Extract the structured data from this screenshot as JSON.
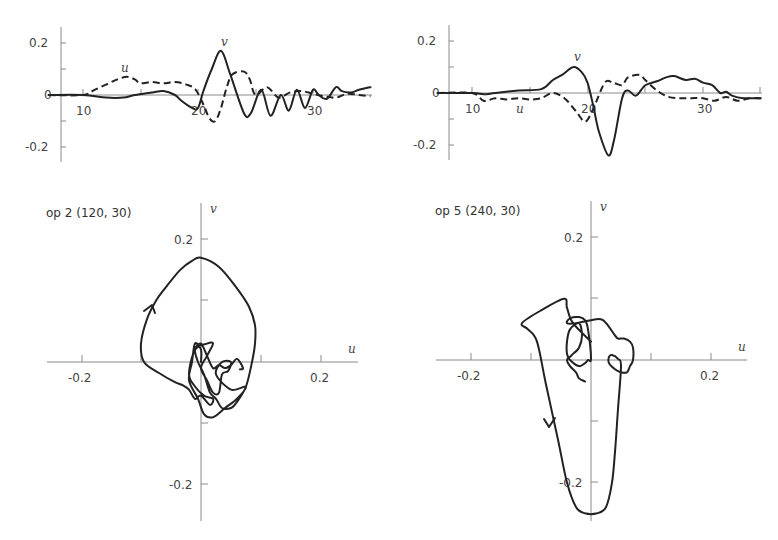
{
  "chart_data": [
    {
      "id": "ts_left",
      "type": "line",
      "xlabel": "",
      "ylabel": "",
      "xlim": [
        7,
        35
      ],
      "ylim": [
        -0.26,
        0.26
      ],
      "xticks": [
        10,
        15,
        20,
        25,
        30
      ],
      "xtick_labels": [
        "10",
        "",
        "20",
        "",
        "30"
      ],
      "yticks": [
        0.2,
        0.1,
        0,
        -0.1,
        -0.2
      ],
      "ytick_labels": [
        "0.2",
        "",
        "0",
        "",
        "-0.2"
      ],
      "annotations": [
        {
          "text": "u",
          "x": 15,
          "y": 0.09
        },
        {
          "text": "v",
          "x": 21.8,
          "y": 0.2
        }
      ],
      "series": [
        {
          "name": "u",
          "style": "dashed",
          "x": [
            7,
            10,
            11,
            12,
            13,
            13.8,
            14.5,
            15,
            16,
            17,
            18,
            19,
            19.8,
            20.5,
            21,
            21.5,
            22,
            22.5,
            23,
            24,
            24.5,
            25,
            26,
            27,
            28,
            29,
            30,
            31,
            32,
            33,
            34,
            35
          ],
          "y": [
            0,
            0,
            0.02,
            0.04,
            0.06,
            0.07,
            0.06,
            0.045,
            0.05,
            0.045,
            0.05,
            0.04,
            0.02,
            -0.04,
            -0.09,
            -0.1,
            -0.05,
            0.03,
            0.08,
            0.09,
            0.06,
            0.0,
            0.03,
            -0.01,
            0.01,
            0.015,
            0.005,
            -0.005,
            -0.01,
            0.005,
            0.0,
            -0.005
          ]
        },
        {
          "name": "v",
          "style": "solid",
          "x": [
            7,
            10,
            12,
            13.5,
            14.5,
            16,
            17,
            18,
            18.5,
            19.5,
            20,
            20.5,
            21.2,
            22,
            22.8,
            24,
            24.6,
            25.5,
            26.3,
            27.2,
            27.9,
            28.6,
            29.3,
            30,
            30.5,
            31.2,
            32,
            32.5,
            33.3,
            34,
            35
          ],
          "y": [
            0,
            0,
            -0.01,
            -0.01,
            0.0,
            0.01,
            0.015,
            0.0,
            -0.02,
            -0.05,
            -0.05,
            0.02,
            0.1,
            0.17,
            0.08,
            -0.07,
            -0.07,
            0.02,
            -0.08,
            0.0,
            -0.06,
            0.02,
            -0.05,
            0.02,
            0.0,
            -0.015,
            0.03,
            0.015,
            0.01,
            0.02,
            0.03
          ]
        }
      ]
    },
    {
      "id": "ts_right",
      "type": "line",
      "xlabel": "",
      "ylabel": "",
      "xlim": [
        7,
        35
      ],
      "ylim": [
        -0.26,
        0.26
      ],
      "xticks": [
        10,
        15,
        20,
        25,
        30,
        35
      ],
      "xtick_labels": [
        "10",
        "",
        "20",
        "",
        "30",
        ""
      ],
      "yticks": [
        0.2,
        0.1,
        0,
        -0.1,
        -0.2
      ],
      "ytick_labels": [
        "0.2",
        "",
        "0",
        "",
        "-0.2"
      ],
      "annotations": [
        {
          "text": "u",
          "x": 14,
          "y": -0.06
        },
        {
          "text": "v",
          "x": 18.8,
          "y": 0.13
        }
      ],
      "series": [
        {
          "name": "u",
          "style": "dashed",
          "x": [
            7,
            10,
            11,
            12,
            13,
            14,
            15,
            16,
            17,
            18,
            19,
            19.8,
            20.5,
            21.5,
            22.2,
            23,
            23.5,
            24.5,
            25,
            26,
            27,
            28,
            29,
            30,
            31,
            32,
            33,
            34,
            35
          ],
          "y": [
            0,
            0,
            -0.03,
            -0.02,
            -0.025,
            -0.02,
            -0.025,
            -0.02,
            0.0,
            -0.02,
            -0.07,
            -0.11,
            -0.06,
            0.04,
            0.04,
            0.03,
            0.06,
            0.07,
            0.05,
            0.01,
            -0.015,
            -0.02,
            -0.02,
            -0.02,
            -0.03,
            -0.015,
            -0.03,
            -0.02,
            -0.02
          ]
        },
        {
          "name": "v",
          "style": "solid",
          "x": [
            7,
            10,
            11,
            12,
            14,
            16,
            17,
            17.8,
            18.8,
            19.5,
            20,
            20.5,
            21,
            21.8,
            22.3,
            23,
            23.5,
            24.2,
            25,
            26,
            26.8,
            27.5,
            28.5,
            29.3,
            30,
            30.8,
            31.5,
            32,
            32.5,
            33.5,
            35
          ],
          "y": [
            0,
            0,
            -0.005,
            0.0,
            0.01,
            0.015,
            0.05,
            0.07,
            0.1,
            0.08,
            0.04,
            -0.05,
            -0.15,
            -0.24,
            -0.18,
            -0.02,
            0.01,
            -0.01,
            0.03,
            0.045,
            0.06,
            0.065,
            0.05,
            0.055,
            0.04,
            0.03,
            0.0,
            0.005,
            -0.01,
            -0.02,
            -0.02
          ]
        }
      ]
    },
    {
      "id": "hodo_left",
      "type": "line",
      "title": "op 2 (120, 30)",
      "xlabel": "u",
      "ylabel": "v",
      "xlim": [
        -0.26,
        0.26
      ],
      "ylim": [
        -0.28,
        0.26
      ],
      "xticks": [
        -0.2,
        -0.1,
        0.1,
        0.2
      ],
      "xtick_labels": [
        "-0.2",
        "",
        "",
        "0.2"
      ],
      "yticks": [
        0.2,
        0.1,
        -0.1,
        -0.2
      ],
      "ytick_labels": [
        "0.2",
        "",
        "",
        "-0.2"
      ],
      "series": [
        {
          "name": "trajectory",
          "style": "solid",
          "u": [
            0,
            0.0,
            -0.01,
            -0.015,
            -0.02,
            -0.005,
            0.005,
            0.02,
            0.04,
            0.06,
            0.075,
            0.05,
            0.025,
            0.035,
            0.05,
            0.045,
            0.035,
            0.03,
            0.02,
            0.01,
            0.0,
            0.01,
            0.02,
            0.01,
            -0.01,
            -0.02,
            -0.01,
            0.005,
            0.02,
            0.015,
            0.0,
            -0.01,
            -0.02,
            -0.03,
            -0.045,
            -0.07,
            -0.095,
            -0.1,
            -0.09,
            -0.075,
            -0.06,
            -0.035,
            -0.015,
            0.0,
            0.03,
            0.06,
            0.08,
            0.09,
            0.09,
            0.085,
            0.075,
            0.06,
            0.05,
            0.035,
            0.025,
            0.015,
            0.005,
            -0.005,
            -0.01,
            0.0,
            0.01,
            0.02,
            0.03,
            0.04,
            0.05,
            0.06,
            0.07,
            0.065
          ],
          "v": [
            0.0,
            0.02,
            0.03,
            0.0,
            -0.03,
            -0.06,
            -0.085,
            -0.09,
            -0.075,
            -0.06,
            -0.04,
            -0.045,
            -0.02,
            0.0,
            0.0,
            -0.015,
            -0.02,
            -0.05,
            -0.05,
            -0.03,
            -0.01,
            0.01,
            0.03,
            0.03,
            0.02,
            -0.02,
            -0.04,
            -0.055,
            -0.06,
            -0.07,
            -0.055,
            -0.06,
            -0.045,
            -0.038,
            -0.032,
            -0.018,
            0.0,
            0.03,
            0.07,
            0.1,
            0.12,
            0.15,
            0.165,
            0.17,
            0.155,
            0.12,
            0.09,
            0.06,
            0.03,
            0.0,
            -0.04,
            -0.065,
            -0.075,
            -0.075,
            -0.06,
            -0.05,
            -0.02,
            0.0,
            0.02,
            0.03,
            0.01,
            -0.01,
            -0.005,
            -0.01,
            -0.005,
            0.005,
            -0.01,
            -0.012
          ]
        }
      ],
      "annotations": [
        {
          "text": "arrow",
          "u": -0.085,
          "v": 0.09
        }
      ]
    },
    {
      "id": "hodo_right",
      "type": "line",
      "title": "op 5 (240, 30)",
      "xlabel": "u",
      "ylabel": "v",
      "xlim": [
        -0.26,
        0.26
      ],
      "ylim": [
        -0.27,
        0.26
      ],
      "xticks": [
        -0.2,
        -0.1,
        0.1,
        0.2
      ],
      "xtick_labels": [
        "-0.2",
        "",
        "",
        "0.2"
      ],
      "yticks": [
        0.2,
        0.1,
        -0.1,
        -0.2
      ],
      "ytick_labels": [
        "0.2",
        "",
        "",
        "-0.2"
      ],
      "series": [
        {
          "name": "trajectory",
          "style": "solid",
          "u": [
            -0.01,
            -0.02,
            -0.025,
            -0.035,
            -0.04,
            -0.035,
            -0.03,
            -0.02,
            -0.015,
            -0.02,
            -0.035,
            -0.04,
            -0.04,
            -0.035,
            -0.02,
            -0.01,
            -0.005,
            0.0,
            -0.005,
            -0.01,
            -0.02,
            -0.035,
            -0.04,
            -0.025,
            0.0,
            0.02,
            0.04,
            0.045,
            0.055,
            0.065,
            0.07,
            0.07,
            0.065,
            0.06,
            0.05,
            0.04,
            0.03,
            0.03,
            0.035,
            0.045,
            0.05,
            0.045,
            0.04,
            0.035,
            0.025,
            0.01,
            -0.01,
            -0.025,
            -0.04,
            -0.055,
            -0.075,
            -0.09,
            -0.105,
            -0.115,
            -0.085,
            -0.045,
            -0.04,
            -0.03,
            0.0
          ],
          "v": [
            -0.035,
            -0.03,
            -0.02,
            -0.01,
            0.0,
            0.005,
            0.01,
            0.02,
            0.04,
            0.06,
            0.05,
            0.03,
            0.01,
            0.0,
            -0.01,
            -0.005,
            0.0,
            0.002,
            0.05,
            0.065,
            0.07,
            0.068,
            0.06,
            0.06,
            0.065,
            0.065,
            0.04,
            0.035,
            0.035,
            0.03,
            0.02,
            0.0,
            -0.01,
            -0.02,
            -0.02,
            -0.015,
            -0.005,
            0.005,
            0.008,
            0.002,
            -0.01,
            -0.08,
            -0.15,
            -0.2,
            -0.24,
            -0.25,
            -0.25,
            -0.24,
            -0.2,
            -0.13,
            -0.04,
            0.03,
            0.05,
            0.06,
            0.08,
            0.1,
            0.085,
            0.06,
            0.03
          ]
        }
      ],
      "annotations": [
        {
          "text": "arrow",
          "u": -0.065,
          "v": -0.1
        }
      ]
    }
  ],
  "panels": {
    "ts_left": {
      "ylabels": [
        "0.2",
        "0",
        "-0.2"
      ],
      "xlabels": [
        "10",
        "20",
        "30"
      ],
      "u_label": "u",
      "v_label": "v"
    },
    "ts_right": {
      "ylabels": [
        "0.2",
        "0",
        "-0.2"
      ],
      "xlabels": [
        "10",
        "20",
        "30"
      ],
      "u_label": "u",
      "v_label": "v"
    },
    "hodo_left": {
      "title": "op 2 (120, 30)",
      "xlabels": [
        "-0.2",
        "0.2"
      ],
      "ylabels": [
        "0.2",
        "-0.2"
      ],
      "u_axis": "u",
      "v_axis": "v"
    },
    "hodo_right": {
      "title": "op 5 (240, 30)",
      "xlabels": [
        "-0.2",
        "0.2"
      ],
      "ylabels": [
        "0.2",
        "-0.2"
      ],
      "u_axis": "u",
      "v_axis": "v"
    }
  }
}
